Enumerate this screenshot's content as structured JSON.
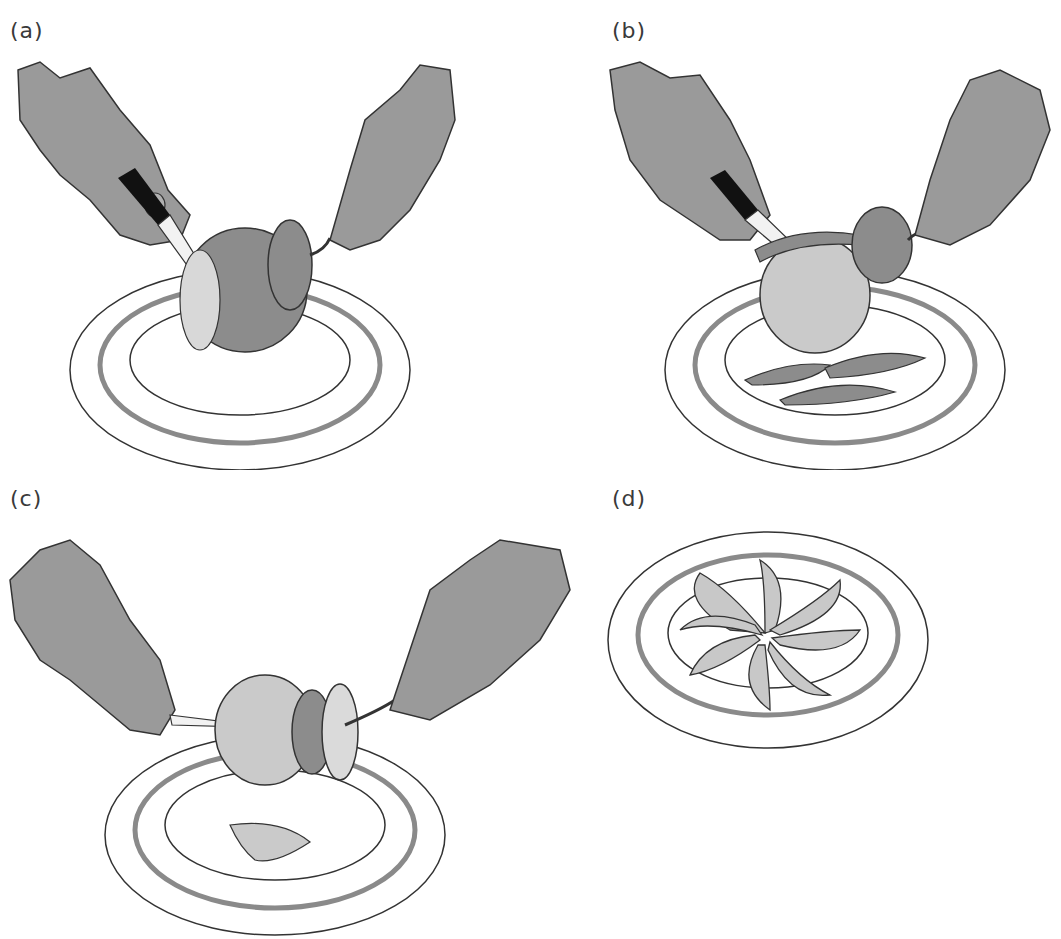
{
  "figure": {
    "panels": [
      {
        "id": "a",
        "label": "(a)",
        "description": "Hand slicing peel off top of orange held by fork over a plate"
      },
      {
        "id": "b",
        "label": "(b)",
        "description": "Peel strips cut away from orange onto plate"
      },
      {
        "id": "c",
        "label": "(c)",
        "description": "Knife cutting segment from peeled orange held on fork"
      },
      {
        "id": "d",
        "label": "(d)",
        "description": "Orange segments arranged in a pinwheel on plate"
      }
    ]
  },
  "colors": {
    "background": "#ffffff",
    "outline": "#333333",
    "hand_fill": "#9a9a9a",
    "peel_fill": "#8c8c8c",
    "flesh_fill": "#c8c8c8",
    "plate_ring": "#8a8a8a",
    "knife_blade": "#f2f2f2",
    "knife_handle": "#111111"
  }
}
